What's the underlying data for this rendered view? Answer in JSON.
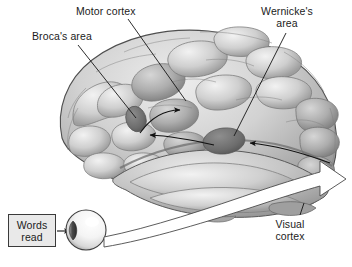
{
  "figure": {
    "width": 352,
    "height": 267,
    "background_color": "#ffffff"
  },
  "labels": {
    "motor_cortex": "Motor cortex",
    "brocas_area": "Broca's area",
    "wernickes_area_line1": "Wernicke's",
    "wernickes_area_line2": "area",
    "visual_cortex_line1": "Visual",
    "visual_cortex_line2": "cortex",
    "words_read_line1": "Words",
    "words_read_line2": "read"
  },
  "icons": {
    "eye": "eye-icon",
    "brain": "brain-icon",
    "white_arrow": "white-arrow-icon",
    "black_arrow_to_motor": "black-arrow-icon",
    "black_arrow_to_broca": "black-arrow-icon",
    "black_arrow_to_wernicke": "black-arrow-icon",
    "black_arrow_words_to_eye": "black-arrow-icon"
  },
  "colors": {
    "text": "#1b1b1b",
    "box_fill": "#e9e9e9",
    "box_border": "#3a3a3a",
    "brain_light": "#e2e2e2",
    "brain_mid": "#b9b9b9",
    "brain_shadow": "#8a8a8a",
    "brain_outline": "#4a4a4a",
    "highlight_patch": "#6f6f6f",
    "white_arrow": "#ffffff",
    "leader_line": "#1b1b1b"
  },
  "regions": [
    {
      "name": "motor-cortex",
      "label": "Motor cortex",
      "marker_x": 185,
      "marker_y": 100
    },
    {
      "name": "brocas-area",
      "label": "Broca's area",
      "marker_x": 136,
      "marker_y": 119
    },
    {
      "name": "wernickes-area",
      "label": "Wernicke's area",
      "marker_x": 224,
      "marker_y": 139
    },
    {
      "name": "visual-cortex",
      "label": "Visual cortex",
      "marker_x": 312,
      "marker_y": 200
    }
  ],
  "flow": [
    {
      "from": "Words read",
      "to": "eye"
    },
    {
      "from": "eye",
      "to": "Visual cortex"
    },
    {
      "from": "Visual cortex",
      "to": "Wernicke's area"
    },
    {
      "from": "Wernicke's area",
      "to": "Broca's area"
    },
    {
      "from": "Broca's area",
      "to": "Motor cortex"
    }
  ]
}
